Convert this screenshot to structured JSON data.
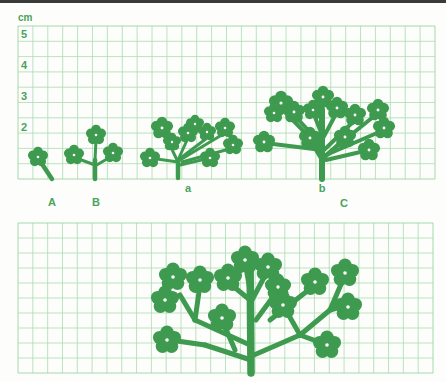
{
  "figure": {
    "unit_label": "cm",
    "y_axis_ticks": [
      {
        "label": "5",
        "y": 38
      },
      {
        "label": "4",
        "y": 69
      },
      {
        "label": "3",
        "y": 100
      },
      {
        "label": "2",
        "y": 131
      }
    ],
    "plant_labels": [
      {
        "label": "A",
        "x": 52,
        "y": 206
      },
      {
        "label": "B",
        "x": 96,
        "y": 206
      },
      {
        "label": "a",
        "x": 188,
        "y": 192
      },
      {
        "label": "b",
        "x": 322,
        "y": 192
      },
      {
        "label": "C",
        "x": 344,
        "y": 207
      }
    ],
    "colors": {
      "plant": "#3d9a4f",
      "grid": "#a9dcb1",
      "grid_border": "#8fcf9a",
      "label": "#4aa35a",
      "background": "#fdfdfb"
    }
  },
  "grids": [
    {
      "name": "top-grid",
      "x": 18,
      "y": 26,
      "w": 417,
      "h": 153,
      "cols": 28,
      "rows": 10
    },
    {
      "name": "bottom-grid",
      "x": 18,
      "y": 223,
      "w": 415,
      "h": 150,
      "cols": 28,
      "rows": 10
    }
  ],
  "plants": [
    {
      "name": "plant-A",
      "stroke": 3,
      "stems": [
        [
          52,
          179,
          42,
          164
        ]
      ],
      "flowers": [
        {
          "x": 38,
          "y": 157,
          "r": 10
        }
      ]
    },
    {
      "name": "plant-B",
      "stroke": 3,
      "stems": [
        [
          95,
          179,
          95,
          160
        ],
        [
          95,
          165,
          76,
          158
        ],
        [
          95,
          160,
          96,
          140
        ],
        [
          95,
          166,
          112,
          156
        ]
      ],
      "flowers": [
        {
          "x": 74,
          "y": 155,
          "r": 10
        },
        {
          "x": 96,
          "y": 135,
          "r": 10
        },
        {
          "x": 113,
          "y": 153,
          "r": 10
        }
      ]
    },
    {
      "name": "plant-a",
      "stroke": 3,
      "stems": [
        [
          178,
          178,
          178,
          160
        ],
        [
          178,
          162,
          150,
          158
        ],
        [
          178,
          162,
          165,
          135
        ],
        [
          178,
          160,
          188,
          138
        ],
        [
          178,
          160,
          207,
          138
        ],
        [
          180,
          160,
          225,
          133
        ],
        [
          182,
          162,
          233,
          148
        ],
        [
          180,
          165,
          210,
          158
        ]
      ],
      "flowers": [
        {
          "x": 150,
          "y": 158,
          "r": 10
        },
        {
          "x": 162,
          "y": 128,
          "r": 11
        },
        {
          "x": 172,
          "y": 142,
          "r": 9
        },
        {
          "x": 188,
          "y": 133,
          "r": 10
        },
        {
          "x": 195,
          "y": 124,
          "r": 9
        },
        {
          "x": 207,
          "y": 132,
          "r": 9
        },
        {
          "x": 225,
          "y": 128,
          "r": 10
        },
        {
          "x": 233,
          "y": 145,
          "r": 10
        },
        {
          "x": 210,
          "y": 158,
          "r": 10
        }
      ]
    },
    {
      "name": "plant-b",
      "stroke": 4,
      "stems": [
        [
          322,
          179,
          322,
          110
        ],
        [
          322,
          150,
          265,
          143
        ],
        [
          322,
          150,
          281,
          108
        ],
        [
          322,
          145,
          294,
          115
        ],
        [
          322,
          135,
          313,
          112
        ],
        [
          322,
          125,
          323,
          100
        ],
        [
          322,
          140,
          337,
          112
        ],
        [
          324,
          150,
          355,
          120
        ],
        [
          326,
          155,
          378,
          113
        ],
        [
          326,
          155,
          384,
          130
        ],
        [
          322,
          160,
          310,
          140
        ],
        [
          324,
          158,
          345,
          138
        ],
        [
          326,
          160,
          369,
          150
        ]
      ],
      "flowers": [
        {
          "x": 264,
          "y": 142,
          "r": 11
        },
        {
          "x": 281,
          "y": 103,
          "r": 12
        },
        {
          "x": 274,
          "y": 113,
          "r": 10
        },
        {
          "x": 294,
          "y": 112,
          "r": 11
        },
        {
          "x": 313,
          "y": 110,
          "r": 10
        },
        {
          "x": 323,
          "y": 97,
          "r": 11
        },
        {
          "x": 337,
          "y": 108,
          "r": 11
        },
        {
          "x": 355,
          "y": 115,
          "r": 11
        },
        {
          "x": 378,
          "y": 110,
          "r": 11
        },
        {
          "x": 384,
          "y": 128,
          "r": 11
        },
        {
          "x": 310,
          "y": 138,
          "r": 11
        },
        {
          "x": 345,
          "y": 137,
          "r": 11
        },
        {
          "x": 369,
          "y": 150,
          "r": 11
        }
      ]
    },
    {
      "name": "plant-C",
      "stroke": 5,
      "stems": [
        [
          251,
          373,
          250,
          255
        ],
        [
          251,
          360,
          205,
          345
        ],
        [
          205,
          345,
          170,
          340
        ],
        [
          235,
          350,
          222,
          320
        ],
        [
          250,
          345,
          195,
          320
        ],
        [
          195,
          320,
          180,
          295
        ],
        [
          195,
          320,
          200,
          285
        ],
        [
          250,
          300,
          228,
          282
        ],
        [
          250,
          290,
          245,
          262
        ],
        [
          252,
          300,
          268,
          270
        ],
        [
          254,
          355,
          300,
          335
        ],
        [
          300,
          335,
          327,
          345
        ],
        [
          300,
          335,
          283,
          305
        ],
        [
          300,
          335,
          330,
          310
        ],
        [
          330,
          310,
          345,
          275
        ],
        [
          330,
          310,
          348,
          305
        ],
        [
          270,
          320,
          315,
          285
        ],
        [
          256,
          320,
          278,
          290
        ]
      ],
      "flowers": [
        {
          "x": 173,
          "y": 277,
          "r": 14
        },
        {
          "x": 165,
          "y": 300,
          "r": 14
        },
        {
          "x": 200,
          "y": 280,
          "r": 14
        },
        {
          "x": 228,
          "y": 278,
          "r": 14
        },
        {
          "x": 245,
          "y": 260,
          "r": 14
        },
        {
          "x": 268,
          "y": 267,
          "r": 14
        },
        {
          "x": 278,
          "y": 287,
          "r": 13
        },
        {
          "x": 283,
          "y": 305,
          "r": 14
        },
        {
          "x": 315,
          "y": 282,
          "r": 14
        },
        {
          "x": 345,
          "y": 273,
          "r": 14
        },
        {
          "x": 348,
          "y": 307,
          "r": 14
        },
        {
          "x": 222,
          "y": 318,
          "r": 14
        },
        {
          "x": 167,
          "y": 340,
          "r": 14
        },
        {
          "x": 327,
          "y": 345,
          "r": 14
        }
      ]
    }
  ]
}
